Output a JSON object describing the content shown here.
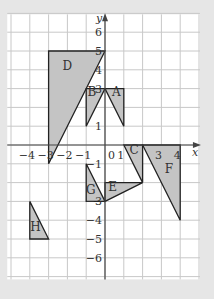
{
  "diagram": {
    "type": "coordinate-grid",
    "axes": {
      "x_label": "x",
      "y_label": "y",
      "x_range": [
        -5,
        5
      ],
      "y_range": [
        -7,
        7
      ],
      "x_tick_labels": [
        {
          "value": -4,
          "text": "−4"
        },
        {
          "value": -3,
          "text": "−3"
        },
        {
          "value": -2,
          "text": "−2"
        },
        {
          "value": -1,
          "text": "−1"
        },
        {
          "value": 0,
          "text": "0"
        },
        {
          "value": 1,
          "text": "1"
        },
        {
          "value": 3,
          "text": "3"
        },
        {
          "value": 4,
          "text": "4"
        }
      ],
      "y_tick_labels": [
        {
          "value": 6,
          "text": "6"
        },
        {
          "value": 5,
          "text": "5"
        },
        {
          "value": 4,
          "text": "4"
        },
        {
          "value": 3,
          "text": "3"
        },
        {
          "value": 1,
          "text": "1"
        },
        {
          "value": -1,
          "text": "−1"
        },
        {
          "value": -3,
          "text": "−3"
        },
        {
          "value": -4,
          "text": "−4"
        },
        {
          "value": -5,
          "text": "−5"
        },
        {
          "value": -6,
          "text": "−6"
        }
      ]
    },
    "shapes": [
      {
        "label": "D",
        "points": [
          [
            -3,
            5
          ],
          [
            0,
            5
          ],
          [
            -3,
            -1
          ]
        ],
        "label_pos": [
          -2,
          4
        ]
      },
      {
        "label": "B",
        "points": [
          [
            -1,
            3
          ],
          [
            0,
            3
          ],
          [
            -1,
            1
          ]
        ],
        "label_pos": [
          -0.7,
          2.6
        ]
      },
      {
        "label": "A",
        "points": [
          [
            0,
            3
          ],
          [
            1,
            3
          ],
          [
            1,
            1
          ]
        ],
        "label_pos": [
          0.6,
          2.6
        ]
      },
      {
        "label": "C",
        "points": [
          [
            1,
            0
          ],
          [
            2,
            0
          ],
          [
            2,
            -2
          ]
        ],
        "label_pos": [
          1.55,
          -0.5
        ]
      },
      {
        "label": "F",
        "points": [
          [
            2,
            0
          ],
          [
            4,
            0
          ],
          [
            4,
            -4
          ]
        ],
        "label_pos": [
          3.4,
          -1.5
        ]
      },
      {
        "label": "G",
        "points": [
          [
            -1,
            -1
          ],
          [
            -1,
            -3
          ],
          [
            0,
            -3
          ]
        ],
        "label_pos": [
          -0.75,
          -2.6
        ]
      },
      {
        "label": "E",
        "points": [
          [
            0,
            -2
          ],
          [
            2,
            -2
          ],
          [
            0,
            -3
          ]
        ],
        "label_pos": [
          0.4,
          -2.45
        ]
      },
      {
        "label": "H",
        "points": [
          [
            -4,
            -3
          ],
          [
            -4,
            -5
          ],
          [
            -3,
            -5
          ]
        ],
        "label_pos": [
          -3.7,
          -4.6
        ]
      }
    ],
    "colors": {
      "background": "#e6e6e6",
      "grid_bg": "#ffffff",
      "grid_line": "#c8c8c8",
      "axis": "#444444",
      "shape_fill": "#c4c4c4",
      "shape_stroke": "#222222",
      "text": "#333333"
    }
  }
}
